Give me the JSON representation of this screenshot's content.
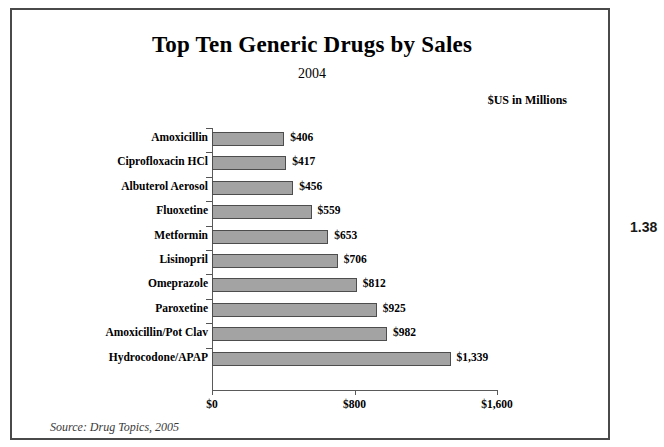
{
  "figure": {
    "title": "Top Ten Generic Drugs by Sales",
    "subtitle": "2004",
    "units_label": "$US in Millions",
    "source_note": "Source: Drug Topics, 2005",
    "marginalia": "1.38"
  },
  "chart_data": {
    "type": "bar",
    "orientation": "horizontal",
    "title": "Top Ten Generic Drugs by Sales",
    "subtitle": "2004",
    "xlabel": "",
    "ylabel": "",
    "units": "$US in Millions",
    "xlim": [
      0,
      1600
    ],
    "xticks": [
      0,
      800,
      1600
    ],
    "xtick_labels": [
      "$0",
      "$800",
      "$1,600"
    ],
    "grid": false,
    "legend": false,
    "bar_color": "#a3a3a3",
    "bar_border_color": "#4d4d4d",
    "categories": [
      "Amoxicillin",
      "Ciprofloxacin HCl",
      "Albuterol Aerosol",
      "Fluoxetine",
      "Metformin",
      "Lisinopril",
      "Omeprazole",
      "Paroxetine",
      "Amoxicillin/Pot Clav",
      "Hydrocodone/APAP"
    ],
    "values": [
      406,
      417,
      456,
      559,
      653,
      706,
      812,
      925,
      982,
      1339
    ],
    "value_labels": [
      "$406",
      "$417",
      "$456",
      "$559",
      "$653",
      "$706",
      "$812",
      "$925",
      "$982",
      "$1,339"
    ],
    "source": "Source: Drug Topics, 2005"
  }
}
